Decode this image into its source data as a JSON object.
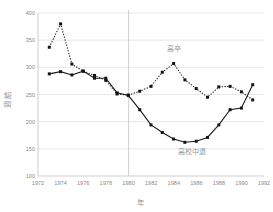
{
  "chart_data": {
    "type": "line",
    "title": "",
    "xlabel": "年",
    "ylabel": "週 給",
    "xlim": [
      1972,
      1992
    ],
    "ylim": [
      100,
      400
    ],
    "grid": true,
    "grid_axis": "y",
    "legend": "inline-annotations",
    "x_ticks": [
      1972,
      1974,
      1976,
      1978,
      1980,
      1982,
      1984,
      1986,
      1988,
      1990,
      1992
    ],
    "y_ticks": [
      100,
      150,
      200,
      250,
      300,
      350,
      400
    ],
    "x": [
      1973,
      1974,
      1975,
      1976,
      1977,
      1978,
      1979,
      1980,
      1981,
      1982,
      1983,
      1984,
      1985,
      1986,
      1987,
      1988,
      1989,
      1990,
      1991
    ],
    "series": [
      {
        "name": "高卒",
        "style": "dotted",
        "marker": "square",
        "annotation": "高卒",
        "annotation_x": 1984,
        "annotation_y": 330,
        "values": [
          337,
          380,
          306,
          293,
          285,
          276,
          251,
          249,
          256,
          265,
          291,
          307,
          277,
          261,
          245,
          264,
          265,
          255,
          240
        ]
      },
      {
        "name": "高校中退",
        "style": "solid",
        "marker": "square",
        "annotation": "高校中退",
        "annotation_x": 1985.6,
        "annotation_y": 141,
        "values": [
          288,
          292,
          286,
          293,
          280,
          280,
          253,
          248,
          222,
          194,
          180,
          168,
          162,
          164,
          171,
          194,
          222,
          225,
          268
        ]
      }
    ],
    "reference_lines": [
      {
        "orientation": "vertical",
        "value": 1980
      }
    ]
  },
  "axis": {
    "y_tick_labels": [
      "400",
      "350",
      "300",
      "250",
      "200",
      "150",
      "100"
    ],
    "x_tick_labels": [
      "1972",
      "1974",
      "1976",
      "1978",
      "1980",
      "1982",
      "1984",
      "1986",
      "1988",
      "1990",
      "1992"
    ],
    "y_title": "週 給",
    "x_title": "年"
  },
  "annotations": {
    "upper_series_label": "高卒",
    "lower_series_label": "高校中退"
  }
}
